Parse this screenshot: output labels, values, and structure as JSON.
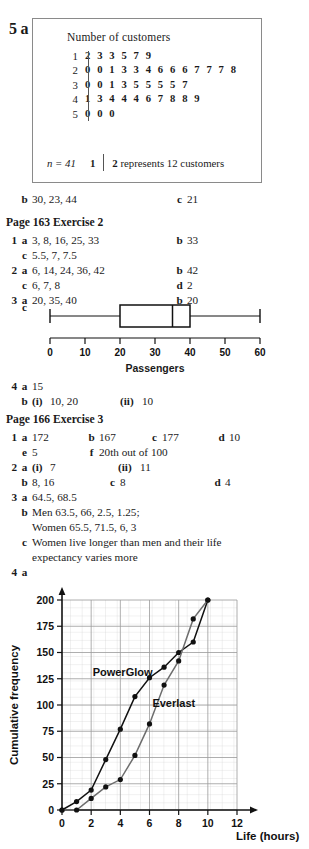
{
  "stem_leaf": {
    "question_number": "5",
    "part_letter": "a",
    "title": "Number of customers",
    "rows": [
      {
        "stem": "1",
        "leaves": "2 3 3 5 7 9"
      },
      {
        "stem": "2",
        "leaves": "0 0 1 3 3 4 6 6 6 7 7 7 8"
      },
      {
        "stem": "3",
        "leaves": "0 0 1 3 5 5 5 5 7"
      },
      {
        "stem": "4",
        "leaves": "1 3 4 4 4 6 7 8 8 9"
      },
      {
        "stem": "5",
        "leaves": "0 0 0"
      }
    ],
    "n_label": "n = 41",
    "key_stem": "1",
    "key_leaf": "2",
    "key_text": "represents 12 customers"
  },
  "q5_parts": {
    "b_letter": "b",
    "b_value": "30, 23, 44",
    "c_letter": "c",
    "c_value": "21"
  },
  "exercise2": {
    "heading": "Page 163 Exercise 2",
    "items": [
      {
        "num": "1",
        "left_letter": "a",
        "left_value": "3, 8, 16, 25, 33",
        "right_letter": "b",
        "right_value": "33"
      },
      {
        "num": "",
        "left_letter": "c",
        "left_value": "5.5, 7, 7.5",
        "right_letter": "",
        "right_value": ""
      },
      {
        "num": "2",
        "left_letter": "a",
        "left_value": "6, 14, 24, 36, 42",
        "right_letter": "b",
        "right_value": "42"
      },
      {
        "num": "",
        "left_letter": "c",
        "left_value": "6, 7, 8",
        "right_letter": "d",
        "right_value": "2"
      },
      {
        "num": "3",
        "left_letter": "a",
        "left_value": "20, 35, 40",
        "right_letter": "b",
        "right_value": "20"
      }
    ],
    "boxplot_letter": "c",
    "q4_num": "4",
    "q4_a_letter": "a",
    "q4_a_value": "15",
    "q4_b_letter": "b",
    "q4_b_i": "(i)",
    "q4_b_i_value": "10, 20",
    "q4_b_ii": "(ii)",
    "q4_b_ii_value": "10"
  },
  "boxplot": {
    "type": "boxplot",
    "xlabel": "Passengers",
    "ticks": [
      0,
      10,
      20,
      30,
      40,
      50,
      60
    ],
    "min": 0,
    "q1": 20,
    "median": 35,
    "q3": 40,
    "max": 60,
    "xlim": [
      0,
      60
    ]
  },
  "exercise3": {
    "heading": "Page 166 Exercise 3",
    "row1": {
      "num": "1",
      "a_let": "a",
      "a_val": "172",
      "b_let": "b",
      "b_val": "167",
      "c_let": "c",
      "c_val": "177",
      "d_let": "d",
      "d_val": "10"
    },
    "row2": {
      "e_let": "e",
      "e_val": "5",
      "f_let": "f",
      "f_val": "20th out of 100"
    },
    "row3": {
      "num": "2",
      "a_let": "a",
      "a_i": "(i)",
      "a_i_val": "7",
      "a_ii": "(ii)",
      "a_ii_val": "11"
    },
    "row4": {
      "b_let": "b",
      "b_val": "8, 16",
      "c_let": "c",
      "c_val": "8",
      "d_let": "d",
      "d_val": "4"
    },
    "row5": {
      "num": "3",
      "a_let": "a",
      "a_val": "64.5, 68.5"
    },
    "row6": {
      "b_let": "b",
      "b_val": "Men 63.5, 66, 2.5, 1.25;"
    },
    "row7": {
      "cont": "Women 65.5, 71.5, 6, 3"
    },
    "row8": {
      "c_let": "c",
      "c_val": "Women live longer than men and their life"
    },
    "row9": {
      "cont": "expectancy varies more"
    },
    "row10": {
      "num": "4",
      "a_let": "a"
    }
  },
  "chart_data": {
    "type": "line",
    "title": "",
    "xlabel": "Life (hours)",
    "ylabel": "Cumulative frequency",
    "xlim": [
      0,
      12
    ],
    "ylim": [
      0,
      200
    ],
    "xticks": [
      0,
      2,
      4,
      6,
      8,
      10,
      12
    ],
    "yticks": [
      0,
      25,
      50,
      75,
      100,
      125,
      150,
      175,
      200
    ],
    "grid": true,
    "legend_position": "inline-annotations",
    "series": [
      {
        "name": "PowerGlow",
        "color": "#111111",
        "x": [
          0,
          1,
          2,
          3,
          4,
          5,
          6,
          7,
          8,
          9,
          10
        ],
        "y": [
          0,
          8,
          19,
          48,
          77,
          108,
          126,
          136,
          150,
          160,
          200
        ]
      },
      {
        "name": "Everlast",
        "color": "#6d6d6d",
        "x": [
          0,
          1,
          2,
          3,
          4,
          5,
          6,
          7,
          8,
          9,
          10
        ],
        "y": [
          0,
          0,
          11,
          22,
          29,
          52,
          82,
          119,
          142,
          182,
          200
        ]
      }
    ],
    "annotations": [
      {
        "text": "PowerGlow",
        "x": 2.1,
        "y": 128
      },
      {
        "text": "Everlast",
        "x": 6.2,
        "y": 98
      }
    ]
  }
}
